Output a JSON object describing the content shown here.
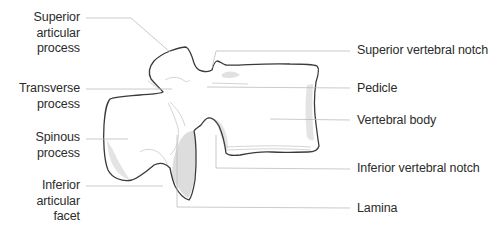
{
  "diagram": {
    "colors": {
      "outline": "#3a3a3a",
      "leader_line": "#bdbdbd",
      "shading": "#d8d8d8",
      "label_text": "#2b2b2b",
      "background": "#ffffff"
    }
  },
  "labels": {
    "left": [
      {
        "id": "superior-articular-process",
        "lines": [
          "Superior",
          "articular",
          "process"
        ]
      },
      {
        "id": "transverse-process",
        "lines": [
          "Transverse",
          "process"
        ]
      },
      {
        "id": "spinous-process",
        "lines": [
          "Spinous",
          "process"
        ]
      },
      {
        "id": "inferior-articular-facet",
        "lines": [
          "Inferior",
          "articular",
          "facet"
        ]
      }
    ],
    "right": [
      {
        "id": "superior-vertebral-notch",
        "text": "Superior vertebral notch"
      },
      {
        "id": "pedicle",
        "text": "Pedicle"
      },
      {
        "id": "vertebral-body",
        "text": "Vertebral body"
      },
      {
        "id": "inferior-vertebral-notch",
        "text": "Inferior vertebral notch"
      },
      {
        "id": "lamina",
        "text": "Lamina"
      }
    ]
  }
}
